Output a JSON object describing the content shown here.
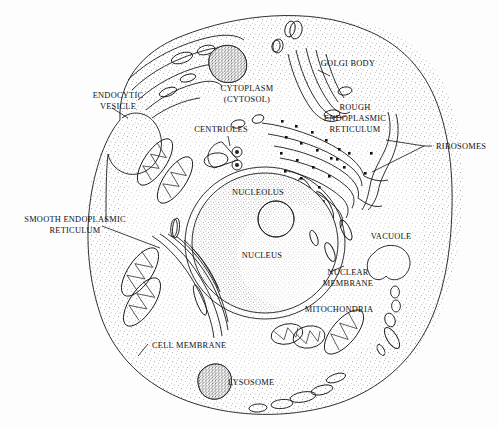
{
  "figure": {
    "type": "labeled-biological-diagram",
    "background_color": "#fdfdfd",
    "ink_color": "#1a1a1a"
  },
  "labels": {
    "endocytic_vesicle": {
      "line1": "ENDOCYTIC",
      "line2": "VESICLE"
    },
    "cytoplasm": {
      "line1": "CYTOPLASM",
      "line2": "(CYTOSOL)"
    },
    "golgi_body": {
      "line1": "GOLGI BODY"
    },
    "rough_er": {
      "line1": "ROUGH",
      "line2": "ENDOPLASMIC",
      "line3": "RETICULUM"
    },
    "ribosomes": {
      "line1": "RIBOSOMES"
    },
    "centrioles": {
      "line1": "CENTRIOLES"
    },
    "nucleolus": {
      "line1": "NUCLEOLUS"
    },
    "nucleus": {
      "line1": "NUCLEUS"
    },
    "smooth_er": {
      "line1": "SMOOTH ENDOPLASMIC",
      "line2": "RETICULUM"
    },
    "vacuole": {
      "line1": "VACUOLE"
    },
    "nuclear_membrane": {
      "line1": "NUCLEAR",
      "line2": "MEMBRANE"
    },
    "mitochondria": {
      "line1": "MITOCHONDRIA"
    },
    "cell_membrane": {
      "line1": "CELL MEMBRANE"
    },
    "lysosome": {
      "line1": "LYSOSOME"
    }
  },
  "structures": [
    {
      "name": "cell-membrane",
      "label": "CELL MEMBRANE",
      "count": 1
    },
    {
      "name": "cytoplasm",
      "label": "CYTOPLASM (CYTOSOL)",
      "count": 1
    },
    {
      "name": "nucleus",
      "label": "NUCLEUS",
      "count": 1
    },
    {
      "name": "nucleolus",
      "label": "NUCLEOLUS",
      "count": 1
    },
    {
      "name": "nuclear-membrane",
      "label": "NUCLEAR MEMBRANE",
      "count": 1
    },
    {
      "name": "golgi-body",
      "label": "GOLGI BODY",
      "count": 1
    },
    {
      "name": "rough-endoplasmic-reticulum",
      "label": "ROUGH ENDOPLASMIC RETICULUM",
      "count": 1
    },
    {
      "name": "smooth-endoplasmic-reticulum",
      "label": "SMOOTH ENDOPLASMIC RETICULUM",
      "count": 1
    },
    {
      "name": "ribosomes",
      "label": "RIBOSOMES",
      "count": 24
    },
    {
      "name": "centrioles",
      "label": "CENTRIOLES",
      "count": 2
    },
    {
      "name": "mitochondria",
      "label": "MITOCHONDRIA",
      "count": 5
    },
    {
      "name": "lysosome",
      "label": "LYSOSOME",
      "count": 1
    },
    {
      "name": "vacuole",
      "label": "VACUOLE",
      "count": 1
    },
    {
      "name": "endocytic-vesicle",
      "label": "ENDOCYTIC VESICLE",
      "count": 1
    }
  ]
}
